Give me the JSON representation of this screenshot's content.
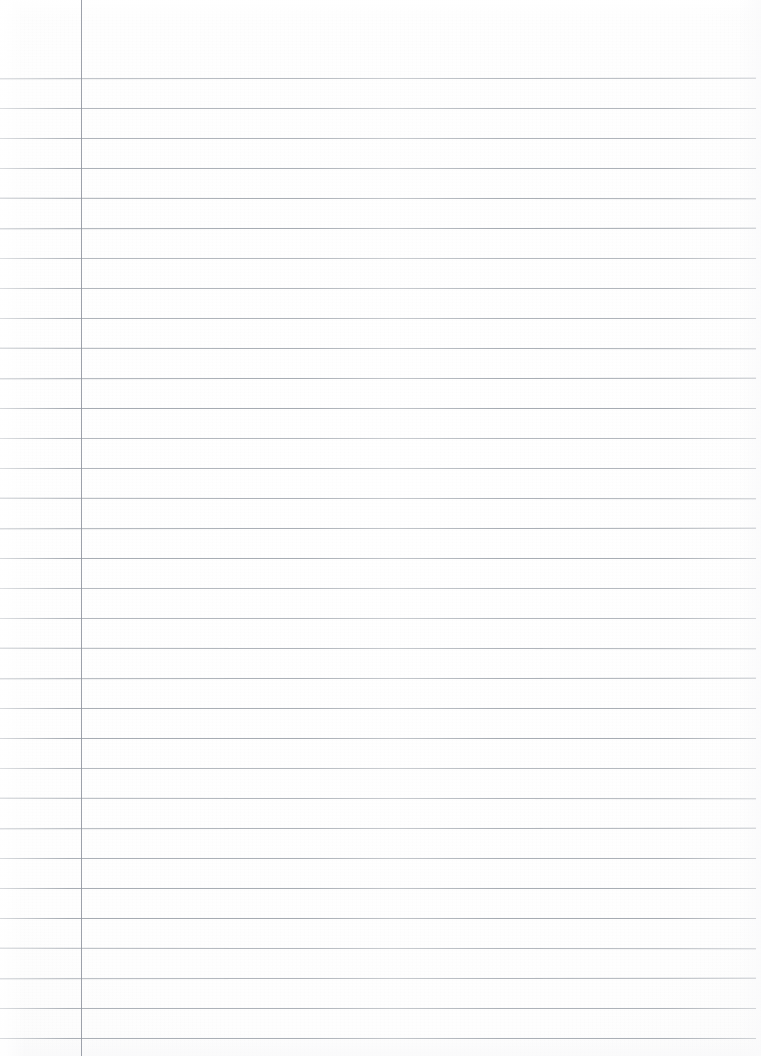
{
  "page": {
    "kind": "scanned-blank-ruled-notebook-paper",
    "width": 761,
    "height": 1056,
    "background_color": "#fdfdfd",
    "has_written_content": false,
    "visible_text": "",
    "header_area_text": "",
    "margin_area_text": ""
  },
  "ruling": {
    "rule_color": "#9aa0a8",
    "rule_thickness": 1,
    "first_rule_y": 78,
    "rule_spacing": 30,
    "rule_count": 33,
    "rule_start_x": 0,
    "rule_end_x": 756,
    "rule_y_positions": [
      78,
      108,
      138,
      168,
      198,
      228,
      258,
      288,
      318,
      348,
      378,
      408,
      438,
      468,
      498,
      528,
      558,
      588,
      618,
      648,
      678,
      708,
      738,
      768,
      798,
      828,
      858,
      888,
      918,
      948,
      978,
      1008,
      1038
    ]
  },
  "margin_rule": {
    "color": "#8f949e",
    "thickness": 1,
    "x": 81,
    "top_y": 0,
    "bottom_y": 1056,
    "orientation": "vertical"
  }
}
